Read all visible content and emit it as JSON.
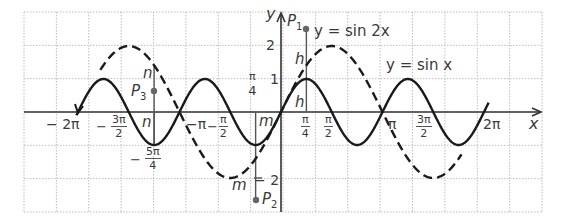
{
  "figure": {
    "grid": {
      "left": 24,
      "right": 542,
      "top": 12,
      "bottom": 212,
      "cols": 16,
      "rows": 6,
      "color": "#bdbdbd"
    },
    "axes": {
      "origin_x": 281,
      "origin_y": 112,
      "px_per_pi": 101.5,
      "px_per_unit": 33,
      "color": "#333333",
      "x_label": "x",
      "y_label": "y"
    },
    "curves": [
      {
        "name": "y = sin 2x",
        "style": "solid",
        "amplitude": 1,
        "frequency": 2,
        "color": "#1a1a1a"
      },
      {
        "name": "y = 2 sin x",
        "style": "dashed",
        "amplitude": 2,
        "frequency": 1,
        "color": "#1a1a1a"
      }
    ],
    "curve_labels": {
      "sin2x": "y = sin 2x",
      "sinx": "y  =  sin  x"
    },
    "x_ticks": {
      "neg_2pi": "− 2π",
      "neg_3pi_2": {
        "sign": "−",
        "num": "3π",
        "den": "2"
      },
      "neg_pi": "−π",
      "neg_pi_2": {
        "sign": "−",
        "num": "π",
        "den": "2"
      },
      "neg_5pi_4": {
        "sign": "−",
        "num": "5π",
        "den": "4"
      },
      "pi_4": {
        "num": "π",
        "den": "4"
      },
      "pi_2": {
        "num": "π",
        "den": "2"
      },
      "pi": "π",
      "3pi_2": {
        "num": "3π",
        "den": "2"
      },
      "2pi": "2π",
      "pi_4_upper": {
        "num": "π",
        "den": "4"
      }
    },
    "y_ticks": {
      "one": "1",
      "two": "2",
      "neg_two": "− 2"
    },
    "points": {
      "P1": {
        "label": "P",
        "sub": "1",
        "x": 306,
        "y": 29
      },
      "P2": {
        "label": "P",
        "sub": "2",
        "x": 256,
        "y": 200
      },
      "P3": {
        "label": "P",
        "sub": "3",
        "x": 154,
        "y": 91
      }
    },
    "segment_labels": {
      "h_upper": "h",
      "h_lower": "h",
      "m_upper": "m",
      "m_lower": "m",
      "n_upper": "n",
      "n_lower": "n"
    }
  }
}
